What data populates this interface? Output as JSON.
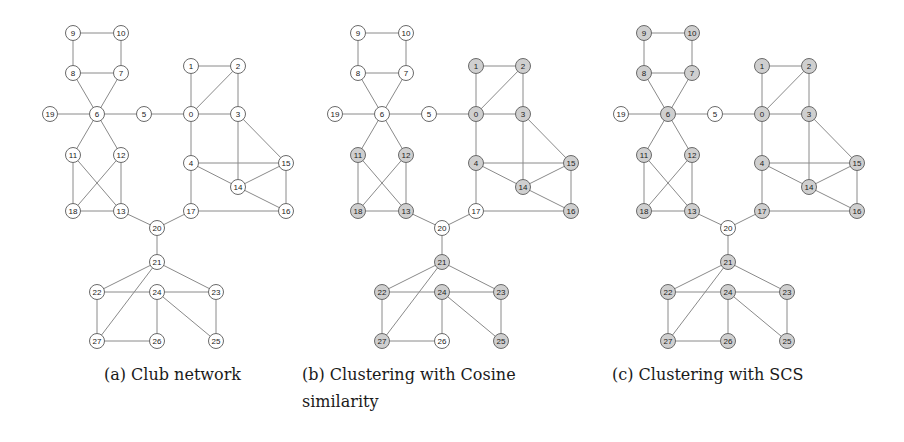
{
  "colors": {
    "shaded": "#cfcfcf",
    "white": "#ffffff",
    "edge": "#8a8a8a"
  },
  "graph": {
    "nodes": [
      {
        "id": "0"
      },
      {
        "id": "1"
      },
      {
        "id": "2"
      },
      {
        "id": "3"
      },
      {
        "id": "4"
      },
      {
        "id": "5"
      },
      {
        "id": "6"
      },
      {
        "id": "7"
      },
      {
        "id": "8"
      },
      {
        "id": "9"
      },
      {
        "id": "10"
      },
      {
        "id": "11"
      },
      {
        "id": "12"
      },
      {
        "id": "13"
      },
      {
        "id": "14"
      },
      {
        "id": "15"
      },
      {
        "id": "16"
      },
      {
        "id": "17"
      },
      {
        "id": "18"
      },
      {
        "id": "19"
      },
      {
        "id": "20"
      },
      {
        "id": "21"
      },
      {
        "id": "22"
      },
      {
        "id": "23"
      },
      {
        "id": "24"
      },
      {
        "id": "25"
      },
      {
        "id": "26"
      },
      {
        "id": "27"
      }
    ],
    "edges": [
      [
        "9",
        "10"
      ],
      [
        "9",
        "8"
      ],
      [
        "10",
        "7"
      ],
      [
        "8",
        "7"
      ],
      [
        "8",
        "6"
      ],
      [
        "7",
        "6"
      ],
      [
        "19",
        "6"
      ],
      [
        "6",
        "5"
      ],
      [
        "5",
        "0"
      ],
      [
        "6",
        "11"
      ],
      [
        "6",
        "12"
      ],
      [
        "11",
        "18"
      ],
      [
        "11",
        "13"
      ],
      [
        "12",
        "18"
      ],
      [
        "12",
        "13"
      ],
      [
        "18",
        "13"
      ],
      [
        "1",
        "0"
      ],
      [
        "1",
        "2"
      ],
      [
        "2",
        "0"
      ],
      [
        "2",
        "3"
      ],
      [
        "0",
        "3"
      ],
      [
        "0",
        "4"
      ],
      [
        "3",
        "14"
      ],
      [
        "3",
        "15"
      ],
      [
        "4",
        "15"
      ],
      [
        "4",
        "14"
      ],
      [
        "4",
        "17"
      ],
      [
        "14",
        "15"
      ],
      [
        "14",
        "16"
      ],
      [
        "15",
        "16"
      ],
      [
        "17",
        "16"
      ],
      [
        "13",
        "20"
      ],
      [
        "17",
        "20"
      ],
      [
        "20",
        "21"
      ],
      [
        "21",
        "22"
      ],
      [
        "21",
        "27"
      ],
      [
        "21",
        "23"
      ],
      [
        "22",
        "24"
      ],
      [
        "24",
        "23"
      ],
      [
        "22",
        "27"
      ],
      [
        "27",
        "26"
      ],
      [
        "24",
        "26"
      ],
      [
        "24",
        "25"
      ],
      [
        "23",
        "25"
      ]
    ]
  },
  "panels": [
    {
      "caption_lines": [
        "(a) Club network"
      ],
      "shaded_nodes": []
    },
    {
      "caption_lines": [
        "(b) Clustering with Cosine",
        "similarity"
      ],
      "shaded_nodes": [
        "0",
        "1",
        "2",
        "3",
        "4",
        "11",
        "12",
        "13",
        "14",
        "15",
        "16",
        "18",
        "21",
        "22",
        "23",
        "24",
        "25",
        "27"
      ]
    },
    {
      "caption_lines": [
        "(c) Clustering with SCS"
      ],
      "shaded_nodes": [
        "0",
        "1",
        "2",
        "3",
        "4",
        "6",
        "7",
        "8",
        "9",
        "10",
        "11",
        "12",
        "13",
        "14",
        "15",
        "16",
        "17",
        "18",
        "21",
        "22",
        "23",
        "24",
        "25",
        "26",
        "27"
      ]
    }
  ]
}
